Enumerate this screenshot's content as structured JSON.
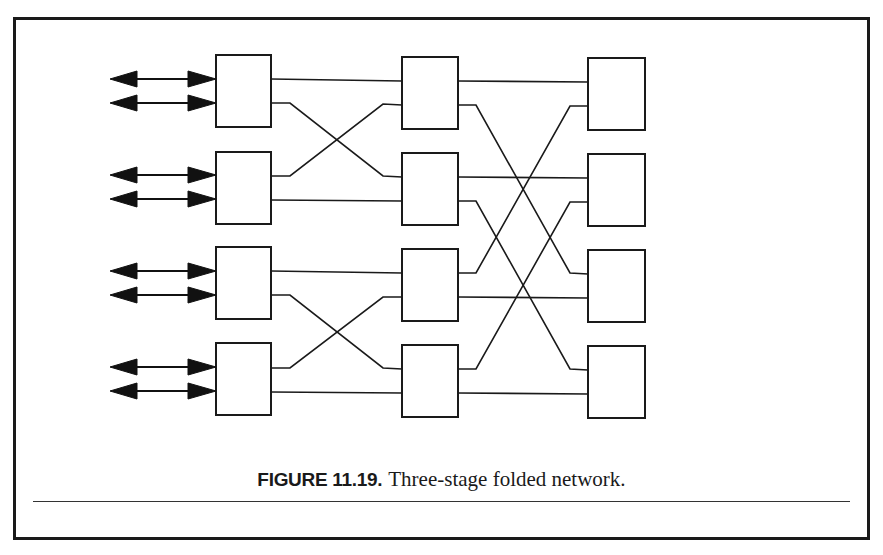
{
  "figure": {
    "label": "FIGURE 11.19.",
    "caption": "Three-stage folded network."
  },
  "diagram": {
    "type": "three-stage folded network",
    "stages": [
      {
        "name": "stage-1",
        "switches": 4,
        "bidirectional_ports_per_switch": 2
      },
      {
        "name": "stage-2",
        "switches": 4
      },
      {
        "name": "stage-3",
        "switches": 4
      }
    ],
    "colors": {
      "stroke": "#1a1a1a",
      "background": "#ffffff"
    }
  }
}
